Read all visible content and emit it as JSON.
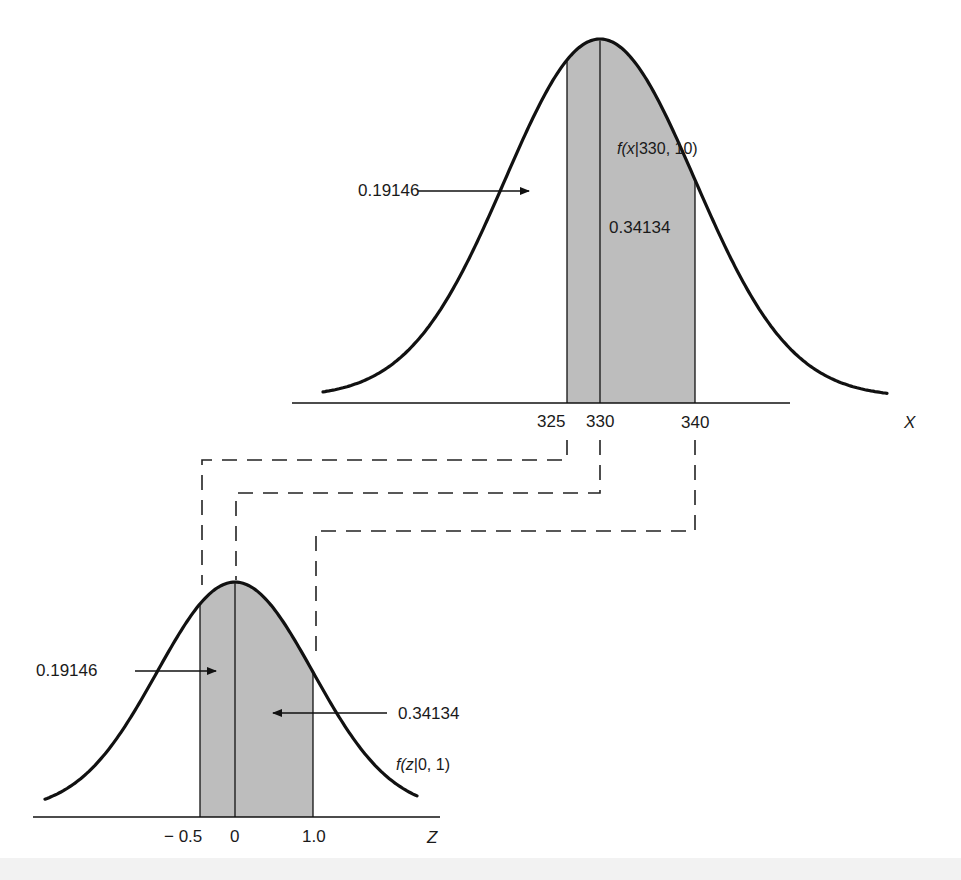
{
  "figure": {
    "upper": {
      "title": "f(x|330, 10)",
      "title_italic": "f(x",
      "title_rest": "|330, 10)",
      "axis_label": "X",
      "mean": 330,
      "sd": 10,
      "ticks": [
        "325",
        "330",
        "340"
      ],
      "area_left_label": "0.19146",
      "area_right_label": "0.34134",
      "shaded_from": 325,
      "shaded_to": 340
    },
    "lower": {
      "title": "f(z|0, 1)",
      "title_italic": "f(z",
      "title_rest": "|0, 1)",
      "axis_label": "Z",
      "mean": 0,
      "sd": 1,
      "ticks": [
        "− 0.5",
        "0",
        "1.0"
      ],
      "area_left_label": "0.19146",
      "area_right_label": "0.34134",
      "shaded_from": -0.5,
      "shaded_to": 1.0
    },
    "mappings": [
      {
        "from": "325",
        "to": "-0.5"
      },
      {
        "from": "330",
        "to": "0"
      },
      {
        "from": "340",
        "to": "1.0"
      }
    ],
    "colors": {
      "curve": "#111111",
      "shade": "#b9b9b9",
      "dash": "#222222",
      "text": "#1a1a1a"
    }
  }
}
